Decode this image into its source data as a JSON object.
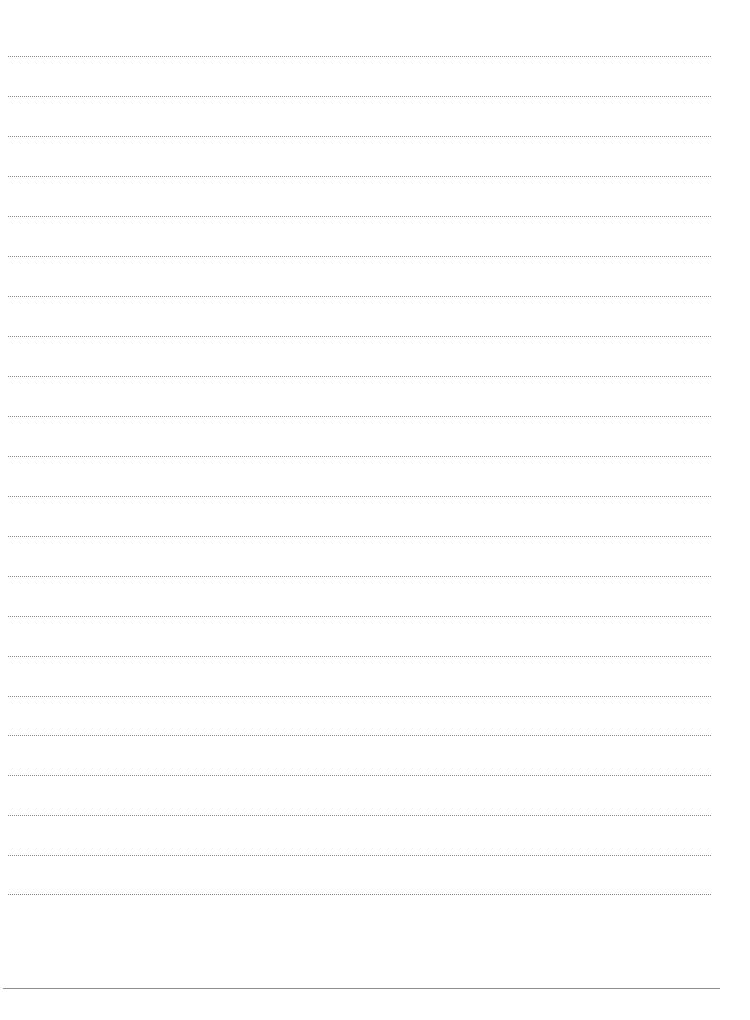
{
  "page": {
    "type": "lined-paper",
    "background_color": "#ffffff",
    "rule_color": "#8a8a8a",
    "rule_style": "dotted",
    "rule_count": 22,
    "rule_positions_y": [
      56,
      96,
      136,
      176,
      216,
      256,
      296,
      336,
      376,
      416,
      456,
      496,
      536,
      576,
      616,
      656,
      696,
      735,
      775,
      815,
      855,
      894
    ],
    "footer_rule": {
      "style": "solid",
      "color": "#8e8e8e",
      "y": 988
    }
  }
}
